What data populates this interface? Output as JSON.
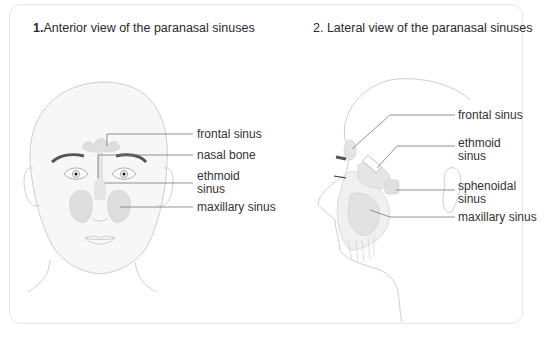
{
  "figure1": {
    "number": "1.",
    "title": "Anterior view of the paranasal sinuses",
    "labels": [
      {
        "line1": "frontal sinus",
        "line2": ""
      },
      {
        "line1": "nasal bone",
        "line2": ""
      },
      {
        "line1": "ethmoid",
        "line2": "sinus"
      },
      {
        "line1": "maxillary sinus",
        "line2": ""
      }
    ]
  },
  "figure2": {
    "title": "2. Lateral view of the paranasal sinuses",
    "labels": [
      {
        "line1": "frontal sinus",
        "line2": ""
      },
      {
        "line1": "ethmoid",
        "line2": "sinus"
      },
      {
        "line1": "sphenoidal",
        "line2": "sinus"
      },
      {
        "line1": "maxillary sinus",
        "line2": ""
      }
    ]
  },
  "colors": {
    "outline": "#c8c8c8",
    "sinus": "#dcdcdc",
    "brow": "#555555",
    "leader": "#777777",
    "border": "#e6e6e6"
  }
}
